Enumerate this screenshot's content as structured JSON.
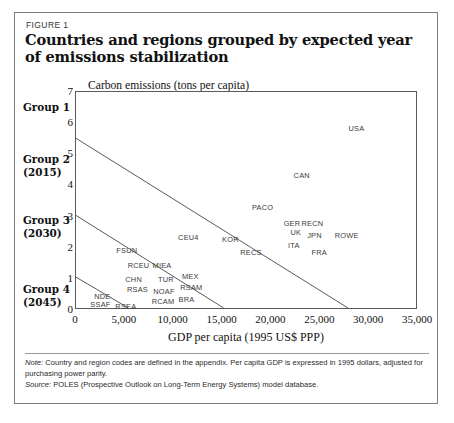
{
  "figure": {
    "label": "FIGURE 1",
    "title": "Countries and regions grouped by expected year of emissions stabilization"
  },
  "groups": [
    {
      "name": "Group 1",
      "year": ""
    },
    {
      "name": "Group 2",
      "year": "(2015)"
    },
    {
      "name": "Group 3",
      "year": "(2030)"
    },
    {
      "name": "Group 4",
      "year": "(2045)"
    }
  ],
  "footnotes": {
    "note_lead": "Note:",
    "note_text": " Country and region codes are defined in the appendix. Per capita GDP is expressed in 1995 dollars, adjusted for purchasing power parity.",
    "source_lead": "Source:",
    "source_text": " POLES (Prospective Outlook on Long-Term Energy Systems) model database."
  },
  "chart_data": {
    "type": "scatter",
    "title": "Countries and regions grouped by expected year of emissions stabilization",
    "xlabel": "GDP per capita (1995 US$ PPP)",
    "ylabel": "Carbon emissions (tons per capita)",
    "xlim": [
      0,
      35000
    ],
    "ylim": [
      0,
      7
    ],
    "xticks": [
      0,
      5000,
      10000,
      15000,
      20000,
      25000,
      30000,
      35000
    ],
    "xticklabels": [
      "0",
      "5,000",
      "10,000",
      "15,000",
      "20,000",
      "25,000",
      "30,000",
      "35,000"
    ],
    "yticks": [
      0,
      1,
      2,
      3,
      4,
      5,
      6,
      7
    ],
    "yticklabels": [
      "0",
      "1",
      "2",
      "3",
      "4",
      "5",
      "6",
      "7"
    ],
    "grid": false,
    "legend": null,
    "points": [
      {
        "label": "USA",
        "x": 28700,
        "y": 5.85
      },
      {
        "label": "CAN",
        "x": 23100,
        "y": 4.35
      },
      {
        "label": "PACO",
        "x": 19100,
        "y": 3.3
      },
      {
        "label": "GER",
        "x": 22100,
        "y": 2.78
      },
      {
        "label": "RECN",
        "x": 24200,
        "y": 2.78
      },
      {
        "label": "UK",
        "x": 22500,
        "y": 2.52
      },
      {
        "label": "JPN",
        "x": 24400,
        "y": 2.42
      },
      {
        "label": "ROWE",
        "x": 27700,
        "y": 2.42
      },
      {
        "label": "ITA",
        "x": 22300,
        "y": 2.1
      },
      {
        "label": "FRA",
        "x": 24900,
        "y": 1.85
      },
      {
        "label": "KOR",
        "x": 15800,
        "y": 2.28
      },
      {
        "label": "RECS",
        "x": 17900,
        "y": 1.85
      },
      {
        "label": "CEU4",
        "x": 11500,
        "y": 2.34
      },
      {
        "label": "FSUN",
        "x": 5200,
        "y": 1.94
      },
      {
        "label": "RCEU",
        "x": 6400,
        "y": 1.46
      },
      {
        "label": "MIEA",
        "x": 8800,
        "y": 1.46
      },
      {
        "label": "CHN",
        "x": 5900,
        "y": 0.98
      },
      {
        "label": "TUR",
        "x": 9200,
        "y": 0.98
      },
      {
        "label": "MEX",
        "x": 11700,
        "y": 1.09
      },
      {
        "label": "RSAM",
        "x": 11800,
        "y": 0.74
      },
      {
        "label": "RSAS",
        "x": 6300,
        "y": 0.66
      },
      {
        "label": "NOAF",
        "x": 9000,
        "y": 0.62
      },
      {
        "label": "NDE",
        "x": 2700,
        "y": 0.45
      },
      {
        "label": "BRA",
        "x": 11300,
        "y": 0.35
      },
      {
        "label": "RCAM",
        "x": 8900,
        "y": 0.3
      },
      {
        "label": "SSAF",
        "x": 2500,
        "y": 0.18
      },
      {
        "label": "RSEA",
        "x": 5100,
        "y": 0.14
      }
    ],
    "group_dividers": [
      {
        "name": "group1-group2-divider",
        "x1": 0,
        "y1": 5.5,
        "x2": 28000,
        "y2": 0
      },
      {
        "name": "group2-group3-divider",
        "x1": 0,
        "y1": 3.0,
        "x2": 15200,
        "y2": 0
      },
      {
        "name": "group3-group4-divider",
        "x1": 0,
        "y1": 1.0,
        "x2": 5400,
        "y2": 0
      }
    ]
  }
}
